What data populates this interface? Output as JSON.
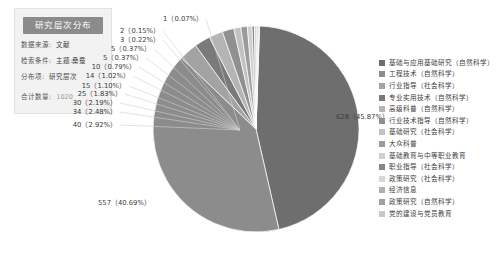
{
  "panel": {
    "title": "研究层次分布",
    "rows": [
      {
        "key": "数据来源:",
        "value": "文献"
      },
      {
        "key": "检索条件:",
        "value": "主题:桑蚕"
      },
      {
        "key": "分布项:",
        "value": "研究层次"
      }
    ],
    "total": {
      "key": "合计数量:",
      "value": "1020"
    }
  },
  "chart_data": {
    "type": "pie",
    "title": "研究层次分布",
    "total": 1369,
    "legend_position": "right",
    "value_label_format": "count (percent)",
    "categories": [
      "基础与应用基础研究（自然科学）",
      "工程技术（自然科学）",
      "行业指导（社会科学）",
      "专业实用技术（自然科学）",
      "高级科普（自然科学）",
      "行业技术指导（自然科学）",
      "基础研究（社会科学）",
      "大众科普",
      "基础教育与中等职业教育",
      "职业指导（社会科学）",
      "政策研究（社会科学）",
      "经济信息",
      "政策研究（自然科学）",
      "党的建设与党员教育"
    ],
    "values": [
      628,
      557,
      40,
      34,
      30,
      25,
      15,
      14,
      10,
      5,
      5,
      3,
      2,
      1
    ],
    "percents": [
      45.87,
      40.69,
      2.92,
      2.48,
      2.19,
      1.83,
      1.1,
      1.02,
      0.79,
      0.37,
      0.37,
      0.22,
      0.15,
      0.07
    ],
    "colors": [
      "#6e6e6e",
      "#8c8c8c",
      "#a3a3a3",
      "#7a7a7a",
      "#b5b5b5",
      "#909090",
      "#c2c2c2",
      "#9b9b9b",
      "#cfcfcf",
      "#868686",
      "#d8d8d8",
      "#b0b0b0",
      "#9f9f9f",
      "#c8c8c8"
    ]
  },
  "callouts": [
    {
      "text": "1（0.07%）",
      "x": 203,
      "y": 15,
      "align": "right"
    },
    {
      "text": "2（0.15%）",
      "x": 160,
      "y": 27,
      "align": "right"
    },
    {
      "text": "3（0.22%）",
      "x": 160,
      "y": 36,
      "align": "right"
    },
    {
      "text": "5（0.37%）",
      "x": 151,
      "y": 45,
      "align": "right"
    },
    {
      "text": "5（0.37%）",
      "x": 143,
      "y": 54,
      "align": "right"
    },
    {
      "text": "10（0.79%）",
      "x": 136,
      "y": 63,
      "align": "right"
    },
    {
      "text": "14（1.02%）",
      "x": 130,
      "y": 72,
      "align": "right"
    },
    {
      "text": "15（1.10%）",
      "x": 126,
      "y": 82,
      "align": "right"
    },
    {
      "text": "25（1.83%）",
      "x": 122,
      "y": 90,
      "align": "right"
    },
    {
      "text": "30（2.19%）",
      "x": 117,
      "y": 99,
      "align": "right"
    },
    {
      "text": "34（2.48%）",
      "x": 117,
      "y": 108,
      "align": "right"
    },
    {
      "text": "40（2.92%）",
      "x": 117,
      "y": 121,
      "align": "right"
    },
    {
      "text": "628（45.87%）",
      "x": 336,
      "y": 113,
      "align": "left"
    },
    {
      "text": "557（40.69%）",
      "x": 98,
      "y": 199,
      "align": "left"
    }
  ],
  "legend": {
    "items": [
      {
        "label": "基础与应用基础研究（自然科学）",
        "color": "#6e6e6e"
      },
      {
        "label": "工程技术（自然科学）",
        "color": "#8c8c8c"
      },
      {
        "label": "行业指导（社会科学）",
        "color": "#a3a3a3"
      },
      {
        "label": "专业实用技术（自然科学）",
        "color": "#7a7a7a"
      },
      {
        "label": "高级科普（自然科学）",
        "color": "#b5b5b5"
      },
      {
        "label": "行业技术指导（自然科学）",
        "color": "#909090"
      },
      {
        "label": "基础研究（社会科学）",
        "color": "#c2c2c2"
      },
      {
        "label": "大众科普",
        "color": "#9b9b9b"
      },
      {
        "label": "基础教育与中等职业教育",
        "color": "#cfcfcf"
      },
      {
        "label": "职业指导（社会科学）",
        "color": "#868686"
      },
      {
        "label": "政策研究（社会科学）",
        "color": "#d8d8d8"
      },
      {
        "label": "经济信息",
        "color": "#b0b0b0"
      },
      {
        "label": "政策研究（自然科学）",
        "color": "#9f9f9f"
      },
      {
        "label": "党的建设与党员教育",
        "color": "#c8c8c8"
      }
    ]
  }
}
